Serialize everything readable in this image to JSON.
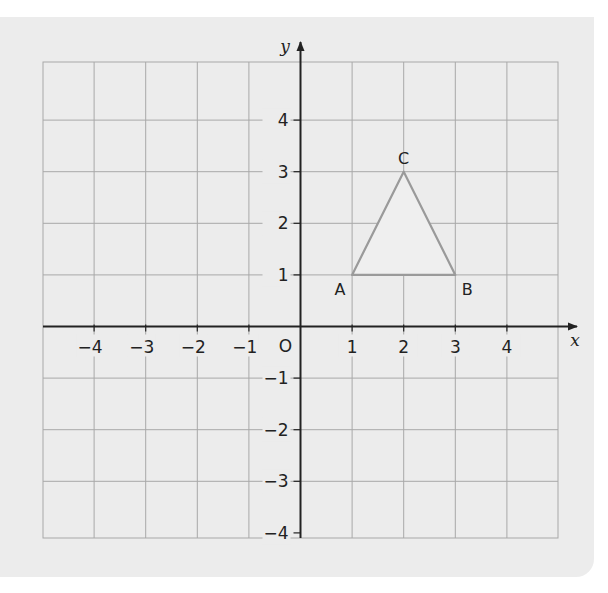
{
  "figure": {
    "axes": {
      "x_label": "x",
      "y_label": "y",
      "origin_label": "O",
      "x_ticks": [
        "-4",
        "-3",
        "-2",
        "-1",
        "1",
        "2",
        "3",
        "4"
      ],
      "y_ticks": [
        "4",
        "3",
        "2",
        "1",
        "-1",
        "-2",
        "-3",
        "-4"
      ],
      "range": {
        "x": [
          -5,
          5
        ],
        "y": [
          -4,
          5
        ]
      }
    },
    "triangle": {
      "points": [
        {
          "label": "A",
          "x": 1,
          "y": 1
        },
        {
          "label": "B",
          "x": 3,
          "y": 1
        },
        {
          "label": "C",
          "x": 2,
          "y": 3
        }
      ],
      "fill": "#efefef",
      "stroke": "#9a9a9a"
    },
    "colors": {
      "panel": "#ececec",
      "grid": "#a8a8a8",
      "axis": "#222222"
    }
  }
}
